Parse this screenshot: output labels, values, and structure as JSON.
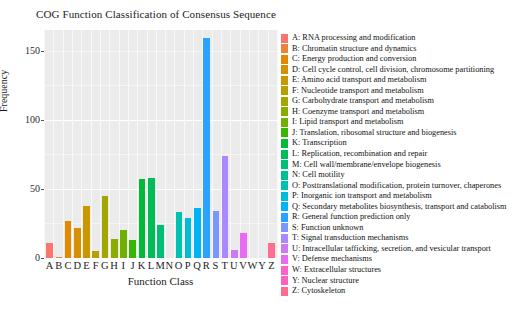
{
  "chart_data": {
    "type": "bar",
    "title": "COG Function Classification of Consensus Sequence",
    "xlabel": "Function Class",
    "ylabel": "Frequency",
    "ylim": [
      0,
      165
    ],
    "yticks": [
      0,
      50,
      100,
      150
    ],
    "ytick_labels": [
      "0",
      "50",
      "100",
      "150"
    ],
    "grid": true,
    "legend_position": "right",
    "categories": [
      "A",
      "B",
      "C",
      "D",
      "E",
      "F",
      "G",
      "H",
      "I",
      "J",
      "K",
      "L",
      "M",
      "N",
      "O",
      "P",
      "Q",
      "R",
      "S",
      "T",
      "U",
      "V",
      "W",
      "Y",
      "Z"
    ],
    "values": [
      11,
      1,
      27,
      22,
      38,
      5,
      45,
      14,
      20,
      13,
      57,
      58,
      24,
      0,
      33,
      29,
      36,
      159,
      34,
      74,
      6,
      18,
      0,
      0,
      11
    ],
    "colors": [
      "#F8766D",
      "#EC8239",
      "#E18A00",
      "#D69100",
      "#C79800",
      "#B79F00",
      "#A3A500",
      "#8CAB00",
      "#6FB000",
      "#39B600",
      "#00BA38",
      "#00BC56",
      "#00BF74",
      "#00C08D",
      "#00C0AF",
      "#00BCD8",
      "#00B2F6",
      "#29A3FF",
      "#7C96FF",
      "#AC88FF",
      "#CD79F4",
      "#E76BF3",
      "#FF61C9",
      "#FF62BC",
      "#FF6C90"
    ],
    "legend_title": "",
    "legend_entries": [
      {
        "key": "A",
        "label": "A: RNA processing and modification",
        "color": "#F8766D"
      },
      {
        "key": "B",
        "label": "B: Chromatin structure and dynamics",
        "color": "#EC8239"
      },
      {
        "key": "C",
        "label": "C: Energy production and conversion",
        "color": "#E18A00"
      },
      {
        "key": "D",
        "label": "D: Cell cycle control, cell division, chromosome partitioning",
        "color": "#D69100"
      },
      {
        "key": "E",
        "label": "E: Amino acid transport and metabolism",
        "color": "#C79800"
      },
      {
        "key": "F",
        "label": "F: Nucleotide transport and metabolism",
        "color": "#B79F00"
      },
      {
        "key": "G",
        "label": "G: Carbohydrate transport and metabolism",
        "color": "#A3A500"
      },
      {
        "key": "H",
        "label": "H: Coenzyme transport and metabolism",
        "color": "#8CAB00"
      },
      {
        "key": "I",
        "label": "I: Lipid transport and metabolism",
        "color": "#6FB000"
      },
      {
        "key": "J",
        "label": "J: Translation, ribosomal structure and biogenesis",
        "color": "#39B600"
      },
      {
        "key": "K",
        "label": "K: Transcription",
        "color": "#00BA38"
      },
      {
        "key": "L",
        "label": "L: Replication, recombination and repair",
        "color": "#00BC56"
      },
      {
        "key": "M",
        "label": "M: Cell wall/membrane/envelope biogenesis",
        "color": "#00BF74"
      },
      {
        "key": "N",
        "label": "N: Cell motility",
        "color": "#00C08D"
      },
      {
        "key": "O",
        "label": "O: Posttranslational modification, protein turnover, chaperones",
        "color": "#00C0AF"
      },
      {
        "key": "P",
        "label": "P: Inorganic ion transport and metabolism",
        "color": "#00BCD8"
      },
      {
        "key": "Q",
        "label": "Q: Secondary metabolites biosynthesis, transport and catabolism",
        "color": "#00B2F6"
      },
      {
        "key": "R",
        "label": "R: General function prediction only",
        "color": "#29A3FF"
      },
      {
        "key": "S",
        "label": "S: Function unknown",
        "color": "#7C96FF"
      },
      {
        "key": "T",
        "label": "T: Signal transduction mechanisms",
        "color": "#AC88FF"
      },
      {
        "key": "U",
        "label": "U: Intracellular tafficking, secretion, and vesicular transport",
        "color": "#CD79F4"
      },
      {
        "key": "V",
        "label": "V: Defense mechanisms",
        "color": "#E76BF3"
      },
      {
        "key": "W",
        "label": "W: Extracellular structures",
        "color": "#FF61C9"
      },
      {
        "key": "Y",
        "label": "Y: Nuclear structure",
        "color": "#FF62BC"
      },
      {
        "key": "Z",
        "label": "Z: Cytoskeleton",
        "color": "#FF6C90"
      }
    ]
  }
}
